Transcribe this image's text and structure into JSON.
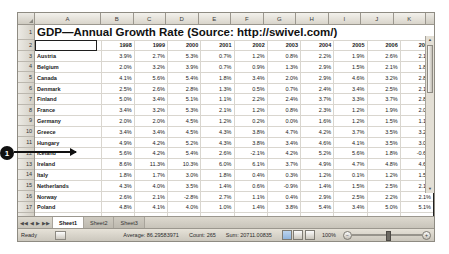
{
  "window": {
    "title": "GDP—Annual Growth Rate (Source: http://swivel.com/)"
  },
  "grid": {
    "column_letters": [
      "A",
      "B",
      "C",
      "D",
      "E",
      "F",
      "G",
      "H",
      "I",
      "J",
      "K"
    ],
    "row_numbers": [
      "1",
      "2",
      "3",
      "4",
      "5",
      "6",
      "7",
      "8",
      "9",
      "10",
      "11",
      "12",
      "13",
      "14",
      "15",
      "16",
      "17",
      "18",
      "19",
      "20",
      "21",
      "22",
      "23"
    ],
    "title_cell": "GDP—Annual Growth Rate (Source: http://swivel.com/)",
    "header_blank": "",
    "years": [
      "1998",
      "1999",
      "2000",
      "2001",
      "2002",
      "2003",
      "2004",
      "2005",
      "2006",
      "2007"
    ],
    "rows": [
      {
        "country": "Austria",
        "values": [
          "3.9%",
          "2.7%",
          "5.3%",
          "0.7%",
          "1.2%",
          "0.8%",
          "2.2%",
          "1.9%",
          "2.6%",
          "2.1%"
        ]
      },
      {
        "country": "Belgium",
        "values": [
          "2.0%",
          "3.2%",
          "3.9%",
          "0.7%",
          "0.9%",
          "1.3%",
          "2.9%",
          "1.5%",
          "2.1%",
          "1.8%"
        ]
      },
      {
        "country": "Canada",
        "values": [
          "4.1%",
          "5.6%",
          "5.4%",
          "1.8%",
          "3.4%",
          "2.0%",
          "2.9%",
          "4.6%",
          "3.2%",
          "2.8%"
        ]
      },
      {
        "country": "Denmark",
        "values": [
          "2.5%",
          "2.6%",
          "2.8%",
          "1.3%",
          "0.5%",
          "0.7%",
          "2.4%",
          "3.4%",
          "2.5%",
          "2.1%"
        ]
      },
      {
        "country": "Finland",
        "values": [
          "5.0%",
          "3.4%",
          "5.1%",
          "1.1%",
          "2.2%",
          "2.4%",
          "3.7%",
          "3.3%",
          "3.7%",
          "2.8%"
        ]
      },
      {
        "country": "France",
        "values": [
          "3.4%",
          "3.2%",
          "5.3%",
          "2.1%",
          "1.2%",
          "0.8%",
          "2.3%",
          "1.2%",
          "1.9%",
          "2.0%"
        ]
      },
      {
        "country": "Germany",
        "values": [
          "2.0%",
          "2.0%",
          "4.5%",
          "1.2%",
          "0.2%",
          "0.0%",
          "1.6%",
          "1.2%",
          "1.5%",
          "1.1%"
        ]
      },
      {
        "country": "Greece",
        "values": [
          "3.4%",
          "3.4%",
          "4.5%",
          "4.3%",
          "3.8%",
          "4.7%",
          "4.2%",
          "3.7%",
          "3.5%",
          "3.2%"
        ]
      },
      {
        "country": "Hungary",
        "values": [
          "4.9%",
          "4.2%",
          "5.2%",
          "4.3%",
          "3.8%",
          "3.4%",
          "4.6%",
          "4.1%",
          "3.5%",
          "3.0%"
        ]
      },
      {
        "country": "Iceland",
        "values": [
          "5.6%",
          "4.2%",
          "5.4%",
          "2.6%",
          "-2.1%",
          "4.2%",
          "5.2%",
          "5.6%",
          "1.8%",
          "-0.6%"
        ]
      },
      {
        "country": "Ireland",
        "values": [
          "8.6%",
          "11.3%",
          "10.3%",
          "6.0%",
          "6.1%",
          "3.7%",
          "4.9%",
          "4.7%",
          "4.8%",
          "4.6%"
        ]
      },
      {
        "country": "Italy",
        "values": [
          "1.8%",
          "1.7%",
          "3.0%",
          "1.8%",
          "0.4%",
          "0.3%",
          "1.2%",
          "0.1%",
          "1.2%",
          "1.5%"
        ]
      },
      {
        "country": "Netherlands",
        "values": [
          "4.3%",
          "4.0%",
          "3.5%",
          "1.4%",
          "0.6%",
          "-0.9%",
          "1.4%",
          "1.5%",
          "2.5%",
          "2.1%"
        ]
      },
      {
        "country": "Norway",
        "values": [
          "2.6%",
          "2.1%",
          "-2.8%",
          "2.7%",
          "1.1%",
          "0.4%",
          "2.9%",
          "2.5%",
          "2.2%",
          "2.1%"
        ]
      },
      {
        "country": "Poland",
        "values": [
          "4.8%",
          "4.1%",
          "4.0%",
          "1.0%",
          "1.4%",
          "3.8%",
          "5.4%",
          "3.4%",
          "5.0%",
          "5.1%"
        ]
      },
      {
        "country": "Portugal",
        "values": [
          "4.6%",
          "3.8%",
          "3.4%",
          "1.7%",
          "0.4%",
          "-1.1%",
          "1.0%",
          "0.4%",
          "1.0%",
          "1.4%"
        ]
      },
      {
        "country": "Romania",
        "values": [
          "-4.8%",
          "-1.2%",
          "0.6%",
          "5.7%",
          "5.1%",
          "5.2%",
          "8.3%",
          "4.1%",
          "6.3%",
          "6.4%"
        ]
      },
      {
        "country": "Russia",
        "values": [
          "-5.3%",
          "6.4%",
          "10.0%",
          "5.5%",
          "4.7%",
          "7.3%",
          "7.1%",
          "6.4%",
          "6.0%",
          "5.2%"
        ]
      },
      {
        "country": "Spain",
        "values": [
          "4.3%",
          "4.2%",
          "7.7%",
          "3.5%",
          "2.7%",
          "2.9%",
          "3.1%",
          "3.4%",
          "3.2%",
          "2.8%"
        ]
      },
      {
        "country": "Sweden",
        "values": [
          "3.6%",
          "4.6%",
          "4.3%",
          "1.0%",
          "2.0%",
          "1.5%",
          "3.6%",
          "2.7%",
          "3.6%",
          "2.8%"
        ]
      },
      {
        "country": "Switzerland",
        "values": [
          "3.9%",
          "1.3%",
          "3.6%",
          "1.0%",
          "0.3%",
          "-0.4%",
          "2.1%",
          "1.6%",
          "3.0%",
          "2.1%"
        ]
      }
    ]
  },
  "callout": {
    "marker": "1"
  },
  "tabs": {
    "nav_first": "◀◀",
    "nav_prev": "◀",
    "nav_next": "▶",
    "nav_last": "▶▶",
    "items": [
      "Sheet1",
      "Sheet2",
      "Sheet3"
    ],
    "active": "Sheet1"
  },
  "statusbar": {
    "ready": "Ready",
    "average": "Average: 86.29583971",
    "count": "Count: 265",
    "sum": "Sum: 20711.00835",
    "zoom": "100%",
    "zoom_out": "−",
    "zoom_in": "+"
  }
}
